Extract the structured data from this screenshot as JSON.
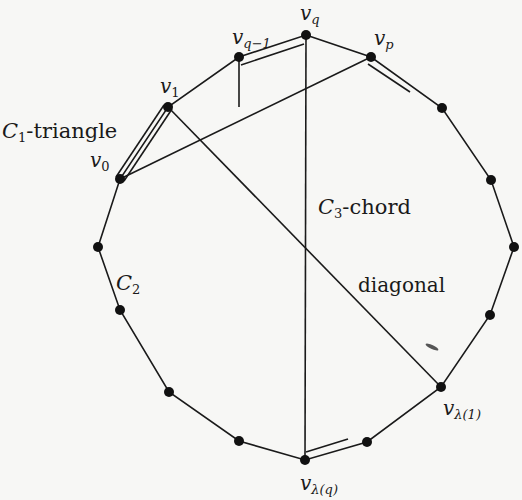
{
  "figure": {
    "background": "#f7f7f5",
    "ink": "#1a1a1a"
  },
  "vertices": [
    {
      "id": "v_q",
      "label": "v",
      "sub": "q",
      "x": 306,
      "y": 35,
      "lx": 300,
      "ly": 20
    },
    {
      "id": "v_p",
      "label": "v",
      "sub": "p",
      "x": 371,
      "y": 57,
      "lx": 376,
      "ly": 44
    },
    {
      "id": "n1",
      "x": 442,
      "y": 108
    },
    {
      "id": "n2",
      "x": 491,
      "y": 180
    },
    {
      "id": "n3",
      "x": 514,
      "y": 247
    },
    {
      "id": "n4",
      "x": 490,
      "y": 315
    },
    {
      "id": "v_lambda1",
      "label": "v",
      "sub": "λ(1)",
      "x": 441,
      "y": 387,
      "lx": 442,
      "ly": 416
    },
    {
      "id": "n5",
      "x": 367,
      "y": 442
    },
    {
      "id": "v_lambdaq",
      "label": "v",
      "sub": "λ(q)",
      "x": 305,
      "y": 460,
      "lx": 300,
      "ly": 490
    },
    {
      "id": "n6",
      "x": 239,
      "y": 441
    },
    {
      "id": "n7",
      "x": 169,
      "y": 392
    },
    {
      "id": "n8",
      "x": 120,
      "y": 310
    },
    {
      "id": "n9",
      "x": 98,
      "y": 247
    },
    {
      "id": "v_0",
      "label": "v",
      "sub": "0",
      "x": 120,
      "y": 179,
      "lx": 88,
      "ly": 167
    },
    {
      "id": "v_1",
      "label": "v",
      "sub": "1",
      "x": 168,
      "y": 107,
      "lx": 160,
      "ly": 92
    },
    {
      "id": "v_qm1",
      "label": "v",
      "sub": "q−1",
      "x": 239,
      "y": 57,
      "lx": 234,
      "ly": 43
    }
  ],
  "annotations": [
    {
      "id": "c1-triangle",
      "main": "C",
      "sub": "1",
      "rest": "-triangle",
      "x": 2,
      "y": 137
    },
    {
      "id": "c3-chord",
      "main": "C",
      "sub": "3",
      "rest": "-chord",
      "x": 318,
      "y": 213
    },
    {
      "id": "c2",
      "main": "C",
      "sub": "2",
      "rest": "",
      "x": 116,
      "y": 290
    },
    {
      "id": "diagonal",
      "main": "",
      "sub": "",
      "rest": "diagonal",
      "x": 358,
      "y": 293
    }
  ],
  "labels": {
    "c1_triangle_main": "C",
    "c1_triangle_sub": "1",
    "c1_triangle_rest": "-triangle",
    "c3_chord_main": "C",
    "c3_chord_sub": "3",
    "c3_chord_rest": "-chord",
    "c2_main": "C",
    "c2_sub": "2",
    "diagonal": "diagonal",
    "v": "v",
    "sub_q": "q",
    "sub_p": "p",
    "sub_qm1": "q−1",
    "sub_1": "1",
    "sub_0": "0",
    "sub_lambda1": "λ(1)",
    "sub_lambdaq": "λ(q)"
  },
  "chords": [
    {
      "name": "c3-chord",
      "from": "v_q",
      "to": "v_lambdaq"
    },
    {
      "name": "diagonal",
      "from": "v_1",
      "to": "v_lambda1"
    },
    {
      "name": "v0-vp-chord",
      "from": "v_0",
      "to": "v_p"
    }
  ]
}
